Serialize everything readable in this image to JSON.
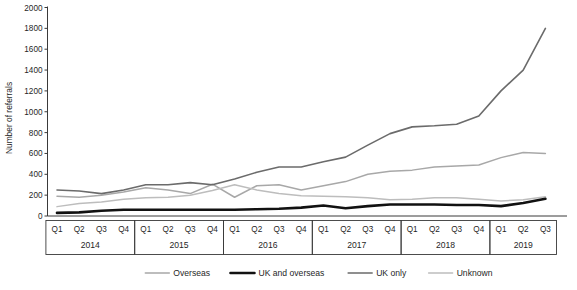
{
  "chart_data": {
    "type": "line",
    "title": "",
    "xlabel": "",
    "ylabel": "Number of referrals",
    "ylim": [
      0,
      2000
    ],
    "ytick_step": 200,
    "yticks": [
      0,
      200,
      400,
      600,
      800,
      1000,
      1200,
      1400,
      1600,
      1800,
      2000
    ],
    "grid": false,
    "legend_position": "bottom",
    "x": [
      "Q1",
      "Q2",
      "Q3",
      "Q4",
      "Q1",
      "Q2",
      "Q3",
      "Q4",
      "Q1",
      "Q2",
      "Q3",
      "Q4",
      "Q1",
      "Q2",
      "Q3",
      "Q4",
      "Q1",
      "Q2",
      "Q3",
      "Q4",
      "Q1",
      "Q2",
      "Q3"
    ],
    "x_groups": [
      {
        "year": "2014",
        "quarters": [
          "Q1",
          "Q2",
          "Q3",
          "Q4"
        ]
      },
      {
        "year": "2015",
        "quarters": [
          "Q1",
          "Q2",
          "Q3",
          "Q4"
        ]
      },
      {
        "year": "2016",
        "quarters": [
          "Q1",
          "Q2",
          "Q3",
          "Q4"
        ]
      },
      {
        "year": "2017",
        "quarters": [
          "Q1",
          "Q2",
          "Q3",
          "Q4"
        ]
      },
      {
        "year": "2018",
        "quarters": [
          "Q1",
          "Q2",
          "Q3",
          "Q4"
        ]
      },
      {
        "year": "2019",
        "quarters": [
          "Q1",
          "Q2",
          "Q3"
        ]
      }
    ],
    "series": [
      {
        "name": "Overseas",
        "color": "#a8a8a8",
        "width": 1.5,
        "values": [
          190,
          180,
          200,
          230,
          270,
          250,
          215,
          305,
          180,
          290,
          300,
          250,
          290,
          330,
          400,
          430,
          440,
          470,
          480,
          490,
          560,
          610,
          600
        ]
      },
      {
        "name": "UK and overseas",
        "color": "#111111",
        "width": 2.6,
        "values": [
          30,
          35,
          50,
          60,
          60,
          60,
          60,
          60,
          60,
          65,
          70,
          80,
          100,
          75,
          95,
          110,
          110,
          110,
          105,
          105,
          95,
          125,
          165
        ]
      },
      {
        "name": "UK only",
        "color": "#6b6b6b",
        "width": 1.6,
        "values": [
          250,
          240,
          215,
          250,
          300,
          300,
          320,
          300,
          355,
          420,
          470,
          470,
          520,
          565,
          680,
          790,
          855,
          865,
          880,
          960,
          1200,
          1400,
          1800
        ]
      },
      {
        "name": "Unknown",
        "color": "#bdbdbd",
        "width": 1.5,
        "values": [
          90,
          120,
          135,
          160,
          175,
          180,
          200,
          245,
          300,
          250,
          215,
          195,
          190,
          185,
          175,
          155,
          160,
          175,
          175,
          160,
          145,
          155,
          185
        ]
      }
    ]
  },
  "legend": {
    "items": [
      {
        "label": "Overseas"
      },
      {
        "label": "UK and overseas"
      },
      {
        "label": "UK only"
      },
      {
        "label": "Unknown"
      }
    ]
  }
}
